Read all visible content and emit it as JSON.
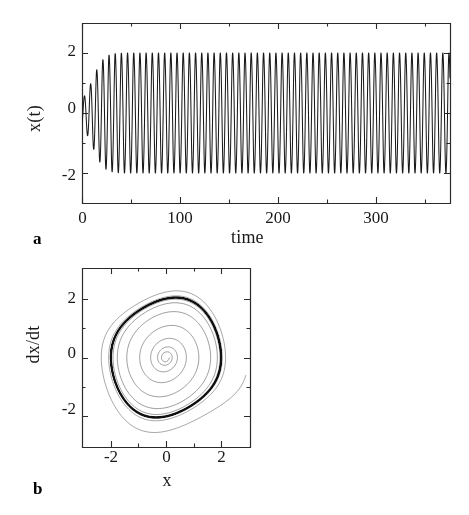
{
  "figure": {
    "background": "#ffffff",
    "line_color": "#1a1a1a",
    "axis_color": "#2b2b2b"
  },
  "panels": [
    {
      "letter": "a",
      "name": "time-series",
      "xlabel": "time",
      "ylabel": "x(t)",
      "x_ticks": [
        "0",
        "100",
        "200",
        "300"
      ],
      "y_ticks": [
        "2",
        "0",
        "-2"
      ]
    },
    {
      "letter": "b",
      "name": "phase-portrait",
      "xlabel": "x",
      "ylabel": "dx/dt",
      "x_ticks": [
        "-2",
        "0",
        "2"
      ],
      "y_ticks": [
        "2",
        "0",
        "-2"
      ]
    }
  ],
  "chart_data": [
    {
      "type": "line",
      "name": "panel-a-time-series",
      "title": "",
      "xlabel": "time",
      "ylabel": "x(t)",
      "xlim": [
        0,
        375
      ],
      "ylim": [
        -3.0,
        3.0
      ],
      "xticks": [
        0,
        100,
        200,
        300
      ],
      "xticklabels": [
        "0",
        "100",
        "200",
        "300"
      ],
      "xminorticks": [
        50,
        150,
        250,
        350
      ],
      "yticks": [
        2,
        0,
        -2
      ],
      "yticklabels": [
        "2",
        "0",
        "-2"
      ],
      "yminorticks": [
        1,
        -1
      ],
      "grid": false,
      "legend": false,
      "description": "Van der Pol oscillator x(t): small initial oscillation near x=-0.4 grows exponentially and saturates at a limit-cycle amplitude of about 2.0 by t~110; period about 6.7 time units.",
      "model": {
        "equation": "d2x/dt2 - mu (1 - x^2) dx/dt + x = 0",
        "mu": 0.2,
        "x0": -0.35,
        "v0": 0.25,
        "t_start": 0,
        "t_end": 375,
        "limit_cycle_amplitude": 2.0
      },
      "envelope_points": {
        "t": [
          0,
          20,
          40,
          60,
          80,
          100,
          120,
          150,
          200,
          250,
          300,
          375
        ],
        "amplitude": [
          0.42,
          0.62,
          0.93,
          1.33,
          1.68,
          1.9,
          1.97,
          2.0,
          2.0,
          2.0,
          2.0,
          2.0
        ]
      }
    },
    {
      "type": "line",
      "name": "panel-b-phase-portrait",
      "title": "",
      "xlabel": "x",
      "ylabel": "dx/dt",
      "xlim": [
        -3.05,
        3.05
      ],
      "ylim": [
        -3.05,
        3.05
      ],
      "xticks": [
        -2,
        0,
        2
      ],
      "xticklabels": [
        "-2",
        "0",
        "2"
      ],
      "xminorticks": [
        -1,
        1
      ],
      "yticks": [
        2,
        0,
        -2
      ],
      "yticklabels": [
        "2",
        "0",
        "-2"
      ],
      "yminorticks": [
        -1,
        1
      ],
      "grid": false,
      "legend": false,
      "description": "Phase plane dx/dt vs x for the same Van der Pol oscillator. An inward spiral from a large outer trajectory and an outward spiral from near the origin both converge onto a dark closed limit cycle of radius about 2.",
      "model": {
        "equation": "d2x/dt2 - mu (1 - x^2) dx/dt + x = 0",
        "mu": 0.2,
        "inner_start": {
          "x": 0.12,
          "v": 0.0
        },
        "outer_start": {
          "x": 2.9,
          "v": -0.6
        },
        "limit_cycle_radius": 2.05
      }
    }
  ]
}
